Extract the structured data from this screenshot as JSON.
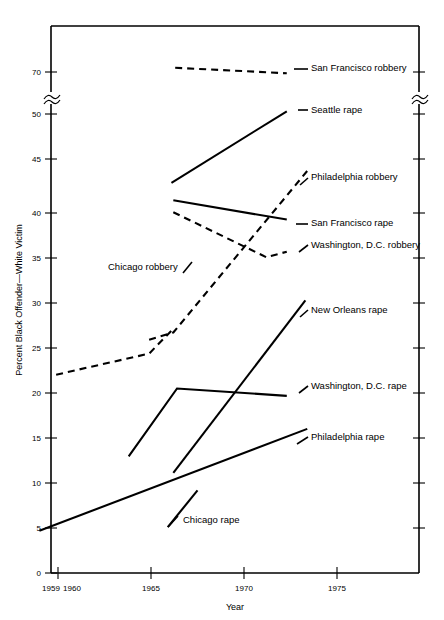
{
  "chart_data": {
    "type": "line",
    "title": "",
    "xlabel": "Year",
    "ylabel": "Percent Black Offender—White Victim",
    "xlim": [
      1959,
      1977
    ],
    "ylim": [
      0,
      75
    ],
    "grid": false,
    "legend_position": "inline-right-labels",
    "axis_break": {
      "between": [
        50,
        70
      ],
      "symbol": "~"
    },
    "xticks": [
      1960,
      1965,
      1970,
      1975
    ],
    "xtick_labels": [
      "1960",
      "1965",
      "1970",
      "1975"
    ],
    "x_axis_origin_label": "1959",
    "yticks": [
      0,
      5,
      10,
      15,
      20,
      25,
      30,
      35,
      40,
      45,
      50,
      70
    ],
    "ytick_labels": [
      "0",
      "5",
      "10",
      "15",
      "20",
      "25",
      "30",
      "35",
      "40",
      "45",
      "50",
      "70"
    ],
    "series": [
      {
        "name": "San Francisco robbery",
        "style": "dashed",
        "label": "San Francisco robbery",
        "x": [
          1966.3,
          1972.3
        ],
        "values": [
          72.0,
          69.4
        ]
      },
      {
        "name": "Seattle rape",
        "style": "solid",
        "label": "Seattle rape",
        "x": [
          1966.1,
          1972.3
        ],
        "values": [
          42.5,
          51.3
        ]
      },
      {
        "name": "Philadelphia robbery",
        "style": "dashed",
        "label": "Philadelphia robbery",
        "x": [
          1964.9,
          1966.2,
          1973.4
        ],
        "values": [
          25.4,
          26.2,
          43.8
        ]
      },
      {
        "name": "San Francisco rape",
        "style": "solid",
        "label": "San Francisco rape",
        "x": [
          1966.2,
          1972.3
        ],
        "values": [
          40.6,
          38.5
        ]
      },
      {
        "name": "Washington, D.C. robbery",
        "style": "dashed",
        "label": "Washington, D.C. robbery",
        "x": [
          1966.2,
          1971.2,
          1972.3
        ],
        "values": [
          39.3,
          34.4,
          35.0
        ]
      },
      {
        "name": "Chicago robbery",
        "style": "dashed",
        "label": "Chicago robbery",
        "x": [
          1959.9,
          1964.9,
          1966.1
        ],
        "values": [
          21.6,
          23.9,
          26.4
        ]
      },
      {
        "name": "New Orleans rape",
        "style": "solid",
        "label": "New Orleans rape",
        "x": [
          1966.2,
          1973.3
        ],
        "values": [
          10.9,
          29.7
        ]
      },
      {
        "name": "Washington, D.C. rape",
        "style": "solid",
        "label": "Washington, D.C. rape",
        "x": [
          1963.8,
          1966.4,
          1972.3
        ],
        "values": [
          12.7,
          20.1,
          19.3
        ]
      },
      {
        "name": "Philadelphia rape",
        "style": "solid",
        "label": "Philadelphia rape",
        "x": [
          1959.0,
          1973.4
        ],
        "values": [
          4.6,
          15.7
        ]
      },
      {
        "name": "Chicago rape",
        "style": "solid",
        "label": "Chicago rape",
        "x": [
          1965.9,
          1967.5
        ],
        "values": [
          5.0,
          9.0
        ]
      }
    ],
    "inline_labels": [
      {
        "text": "San Francisco robbery",
        "x": 311,
        "y": 71
      },
      {
        "text": "Seattle rape",
        "x": 311,
        "y": 113
      },
      {
        "text": "Philadelphia robbery",
        "x": 311,
        "y": 180
      },
      {
        "text": "San Francisco rape",
        "x": 311,
        "y": 226
      },
      {
        "text": "Washington, D.C. robbery",
        "x": 311,
        "y": 248
      },
      {
        "text": "New Orleans rape",
        "x": 311,
        "y": 313
      },
      {
        "text": "Washington, D.C. rape",
        "x": 311,
        "y": 389
      },
      {
        "text": "Philadelphia rape",
        "x": 311,
        "y": 440
      },
      {
        "text": "Chicago robbery",
        "x": 108,
        "y": 270
      },
      {
        "text": "Chicago rape",
        "x": 183,
        "y": 523
      }
    ]
  }
}
